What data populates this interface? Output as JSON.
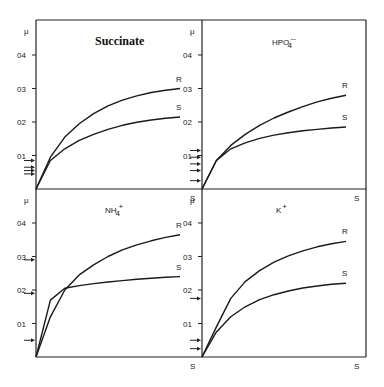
{
  "chart_data": [
    {
      "type": "line",
      "title": "Succinate",
      "xlabel": "S",
      "ylabel": "μ",
      "yticks": [
        "0.1",
        "0.2",
        "0.3",
        "0.4"
      ],
      "ylim": [
        0,
        0.5
      ],
      "grid": false,
      "x": [
        0,
        0.1,
        0.2,
        0.3,
        0.4,
        0.5,
        0.6,
        0.7,
        0.8,
        0.9,
        1.0
      ],
      "series": [
        {
          "name": "R",
          "values": [
            0,
            0.095,
            0.155,
            0.195,
            0.225,
            0.248,
            0.265,
            0.278,
            0.288,
            0.295,
            0.3
          ]
        },
        {
          "name": "S",
          "values": [
            0,
            0.085,
            0.12,
            0.145,
            0.163,
            0.178,
            0.19,
            0.199,
            0.206,
            0.211,
            0.215
          ]
        }
      ],
      "arrows": [
        0.085,
        0.065,
        0.055,
        0.045
      ]
    },
    {
      "type": "line",
      "title": "HPO4--",
      "xlabel": "S",
      "ylabel": "μ",
      "yticks": [
        "0.1",
        "0.2",
        "0.3",
        "0.4"
      ],
      "ylim": [
        0,
        0.5
      ],
      "grid": false,
      "x": [
        0,
        0.1,
        0.2,
        0.3,
        0.4,
        0.5,
        0.6,
        0.7,
        0.8,
        0.9,
        1.0
      ],
      "series": [
        {
          "name": "R",
          "values": [
            0,
            0.085,
            0.13,
            0.163,
            0.19,
            0.212,
            0.23,
            0.246,
            0.26,
            0.271,
            0.28
          ]
        },
        {
          "name": "S",
          "values": [
            0,
            0.085,
            0.12,
            0.138,
            0.151,
            0.161,
            0.168,
            0.174,
            0.178,
            0.182,
            0.185
          ]
        }
      ],
      "arrows": [
        0.115,
        0.095,
        0.075,
        0.055,
        0.025
      ]
    },
    {
      "type": "line",
      "title": "NH4+",
      "xlabel": "S",
      "ylabel": "μ",
      "yticks": [
        "0.1",
        "0.2",
        "0.3",
        "0.4"
      ],
      "ylim": [
        0,
        0.5
      ],
      "grid": false,
      "x": [
        0,
        0.1,
        0.2,
        0.3,
        0.4,
        0.5,
        0.6,
        0.7,
        0.8,
        0.9,
        1.0
      ],
      "series": [
        {
          "name": "R",
          "values": [
            0,
            0.12,
            0.2,
            0.245,
            0.275,
            0.3,
            0.32,
            0.335,
            0.347,
            0.357,
            0.365
          ]
        },
        {
          "name": "S",
          "values": [
            0,
            0.17,
            0.205,
            0.213,
            0.219,
            0.224,
            0.228,
            0.232,
            0.235,
            0.238,
            0.24
          ]
        }
      ],
      "arrows": [
        0.29,
        0.19,
        0.05
      ]
    },
    {
      "type": "line",
      "title": "K+",
      "xlabel": "S",
      "ylabel": "μ",
      "yticks": [
        "0.1",
        "0.2",
        "0.3",
        "0.4"
      ],
      "ylim": [
        0,
        0.5
      ],
      "grid": false,
      "x": [
        0,
        0.1,
        0.2,
        0.3,
        0.4,
        0.5,
        0.6,
        0.7,
        0.8,
        0.9,
        1.0
      ],
      "series": [
        {
          "name": "R",
          "values": [
            0,
            0.09,
            0.175,
            0.225,
            0.258,
            0.283,
            0.302,
            0.317,
            0.329,
            0.338,
            0.345
          ]
        },
        {
          "name": "S",
          "values": [
            0,
            0.075,
            0.12,
            0.15,
            0.171,
            0.186,
            0.197,
            0.206,
            0.212,
            0.217,
            0.22
          ]
        }
      ],
      "arrows": [
        0.175,
        0.05,
        0.025
      ]
    }
  ],
  "labels": {
    "mu": "μ",
    "s": "S",
    "r_curve": "R",
    "s_curve": "S",
    "tick_01": "01",
    "tick_02": "02",
    "tick_03": "03",
    "tick_04": "04",
    "panel_titles": [
      "Succinate",
      "HPO",
      "NH",
      "K"
    ],
    "panel_title_sub": [
      "",
      "4",
      "4",
      ""
    ],
    "panel_title_sup": [
      "",
      "--",
      "+",
      "+"
    ]
  }
}
